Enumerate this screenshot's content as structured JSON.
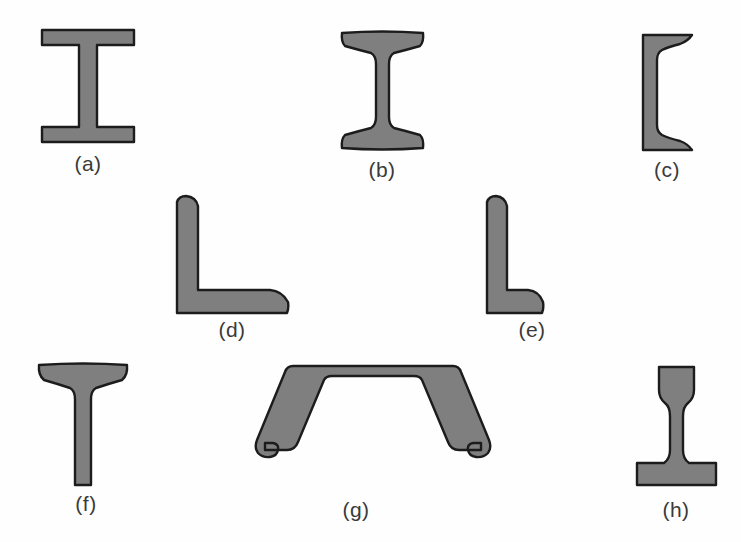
{
  "figure": {
    "background_color": "#fefefe",
    "fill_color": "#7f7f7f",
    "outline_color": "#1c1c1c",
    "caption_color": "#3a3a3a",
    "shapes": [
      {
        "id": "w-shape-wide-flange-beam",
        "caption": "(a)",
        "caption_x": 46,
        "caption_y": 152,
        "caption_width": 84,
        "x": 40,
        "y": 28,
        "w": 96,
        "h": 116
      },
      {
        "id": "s-shape-american-standard-beam",
        "caption": "(b)",
        "caption_x": 340,
        "caption_y": 158,
        "caption_width": 84,
        "x": 336,
        "y": 30,
        "w": 93,
        "h": 121
      },
      {
        "id": "c-shape-channel",
        "caption": "(c)",
        "caption_x": 625,
        "caption_y": 158,
        "caption_width": 84,
        "x": 640,
        "y": 33,
        "w": 54,
        "h": 119
      },
      {
        "id": "unequal-leg-angle-long-horizontal",
        "caption": "(d)",
        "caption_x": 190,
        "caption_y": 318,
        "caption_width": 84,
        "x": 174,
        "y": 194,
        "w": 117,
        "h": 122
      },
      {
        "id": "unequal-leg-angle-long-vertical",
        "caption": "(e)",
        "caption_x": 490,
        "caption_y": 318,
        "caption_width": 84,
        "x": 484,
        "y": 194,
        "w": 62,
        "h": 122
      },
      {
        "id": "structural-tee",
        "caption": "(f)",
        "caption_x": 44,
        "caption_y": 492,
        "caption_width": 84,
        "x": 34,
        "y": 362,
        "w": 98,
        "h": 126
      },
      {
        "id": "cold-formed-hat-section",
        "caption": "(g)",
        "caption_x": 314,
        "caption_y": 498,
        "caption_width": 84,
        "x": 243,
        "y": 362,
        "w": 260,
        "h": 102
      },
      {
        "id": "railroad-rail-section",
        "caption": "(h)",
        "caption_x": 634,
        "caption_y": 498,
        "caption_width": 84,
        "x": 634,
        "y": 364,
        "w": 85,
        "h": 124
      }
    ]
  }
}
